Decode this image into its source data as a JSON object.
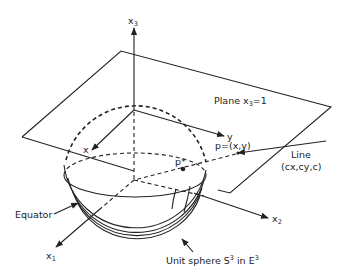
{
  "figure": {
    "labels": {
      "x3_axis": "x",
      "x3_sub": "3",
      "plane_label": "Plane x",
      "plane_sub": "3",
      "plane_eq": "=1",
      "y_axis": "y",
      "x_axis": "x",
      "p_point": "p=(x,y)",
      "p_star": "p*",
      "line_label_1": "Line",
      "line_label_2": "(cx,cy,c)",
      "equator": "Equator",
      "x1_axis": "x",
      "x1_sub": "1",
      "x2_axis": "x",
      "x2_sub": "2",
      "sphere_label": "Unit sphere S",
      "sphere_sup": "3",
      "sphere_in": " in E",
      "sphere_sup2": "3"
    },
    "colors": {
      "ink": "#222222",
      "background": "#ffffff"
    }
  }
}
